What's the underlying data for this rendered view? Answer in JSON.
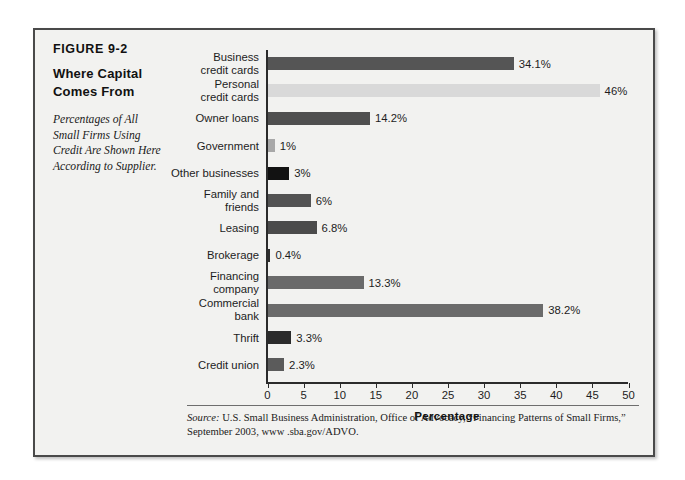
{
  "figure": {
    "number": "FIGURE 9-2",
    "title_line1": "Where Capital",
    "title_line2": "Comes From",
    "subtitle_line1": "Percentages of All",
    "subtitle_line2": "Small Firms Using",
    "subtitle_line3": "Credit Are Shown Here",
    "subtitle_line4": "According to Supplier."
  },
  "source": {
    "label": "Source:",
    "text": " U.S. Small Business Administration, Office of Advocacy, “Financing Patterns of Small Firms,” September 2003, www .sba.gov/ADVO."
  },
  "chart_data": {
    "type": "bar",
    "orientation": "horizontal",
    "title": "Where Capital Comes From",
    "xlabel": "Percentage",
    "ylabel": "",
    "xlim": [
      0,
      50
    ],
    "xticks": [
      0,
      5,
      10,
      15,
      20,
      25,
      30,
      35,
      40,
      45,
      50
    ],
    "grid": false,
    "legend": false,
    "categories": [
      "Business credit cards",
      "Personal credit cards",
      "Owner loans",
      "Government",
      "Other businesses",
      "Family and friends",
      "Leasing",
      "Brokerage",
      "Financing company",
      "Commercial bank",
      "Thrift",
      "Credit union"
    ],
    "values": [
      34.1,
      46,
      14.2,
      1,
      3,
      6,
      6.8,
      0.4,
      13.3,
      38.2,
      3.3,
      2.3
    ],
    "value_labels": [
      "34.1%",
      "46%",
      "14.2%",
      "1%",
      "3%",
      "6%",
      "6.8%",
      "0.4%",
      "13.3%",
      "38.2%",
      "3.3%",
      "2.3%"
    ],
    "bars": [
      {
        "label_line1": "Business",
        "label_line2": "credit cards",
        "value": 34.1,
        "value_label": "34.1%",
        "color": "#555555"
      },
      {
        "label_line1": "Personal",
        "label_line2": "credit cards",
        "value": 46,
        "value_label": "46%",
        "color": "#d9d9d9"
      },
      {
        "label_line1": "Owner loans",
        "label_line2": "",
        "value": 14.2,
        "value_label": "14.2%",
        "color": "#4f4f4f"
      },
      {
        "label_line1": "Government",
        "label_line2": "",
        "value": 1,
        "value_label": "1%",
        "color": "#a8a8a8"
      },
      {
        "label_line1": "Other businesses",
        "label_line2": "",
        "value": 3,
        "value_label": "3%",
        "color": "#121212"
      },
      {
        "label_line1": "Family and",
        "label_line2": "friends",
        "value": 6,
        "value_label": "6%",
        "color": "#535353"
      },
      {
        "label_line1": "Leasing",
        "label_line2": "",
        "value": 6.8,
        "value_label": "6.8%",
        "color": "#4b4b4b"
      },
      {
        "label_line1": "Brokerage",
        "label_line2": "",
        "value": 0.4,
        "value_label": "0.4%",
        "color": "#2e2e2e"
      },
      {
        "label_line1": "Financing",
        "label_line2": "company",
        "value": 13.3,
        "value_label": "13.3%",
        "color": "#6a6a6a"
      },
      {
        "label_line1": "Commercial",
        "label_line2": "bank",
        "value": 38.2,
        "value_label": "38.2%",
        "color": "#6b6b6b"
      },
      {
        "label_line1": "Thrift",
        "label_line2": "",
        "value": 3.3,
        "value_label": "3.3%",
        "color": "#2b2b2b"
      },
      {
        "label_line1": "Credit union",
        "label_line2": "",
        "value": 2.3,
        "value_label": "2.3%",
        "color": "#5b5b5b"
      }
    ]
  }
}
